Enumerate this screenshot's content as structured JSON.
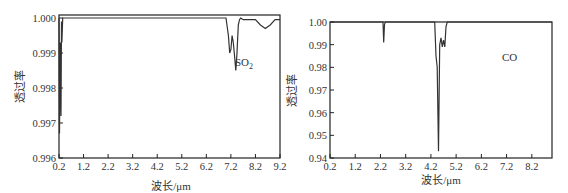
{
  "chart_data": [
    {
      "type": "line",
      "title": "",
      "annotation": "SO2",
      "xlabel": "波长/μm",
      "ylabel": "透过率",
      "xlim": [
        0.2,
        9.2
      ],
      "ylim": [
        0.996,
        1.0
      ],
      "xticks": [
        "0.2",
        "1.2",
        "2.2",
        "3.2",
        "4.2",
        "5.2",
        "6.2",
        "7.2",
        "8.2",
        "9.2"
      ],
      "yticks": [
        "0.996",
        "0.997",
        "0.998",
        "0.999",
        "1.000"
      ],
      "grid": false,
      "series": [
        {
          "name": "SO2",
          "x": [
            0.2,
            0.22,
            0.25,
            0.28,
            0.3,
            0.32,
            0.35,
            7.0,
            7.1,
            7.15,
            7.2,
            7.25,
            7.3,
            7.35,
            7.4,
            7.45,
            7.5,
            7.55,
            7.6,
            7.7,
            8.2,
            8.4,
            8.6,
            8.8,
            9.0,
            9.2
          ],
          "y": [
            1.0,
            0.9967,
            0.9993,
            0.9972,
            0.9999,
            0.9993,
            1.0,
            1.0,
            0.9995,
            0.999,
            0.9991,
            0.9995,
            0.9993,
            0.9989,
            0.9985,
            0.999,
            0.9998,
            0.99995,
            1.0,
            0.99995,
            0.99995,
            0.9998,
            0.9997,
            0.9998,
            0.99995,
            0.99995
          ]
        }
      ]
    },
    {
      "type": "line",
      "title": "",
      "annotation": "CO",
      "xlabel": "波长/μm",
      "ylabel": "透过率",
      "xlim": [
        0.2,
        9.0
      ],
      "ylim": [
        0.94,
        1.0
      ],
      "xticks": [
        "0.2",
        "1.2",
        "2.2",
        "3.2",
        "4.2",
        "5.2",
        "6.2",
        "7.2",
        "8.2"
      ],
      "yticks": [
        "0.94",
        "0.95",
        "0.96",
        "0.97",
        "0.98",
        "0.99",
        "1.00"
      ],
      "grid": false,
      "series": [
        {
          "name": "CO",
          "x": [
            0.2,
            2.3,
            2.33,
            2.36,
            2.4,
            4.35,
            4.4,
            4.45,
            4.5,
            4.55,
            4.6,
            4.65,
            4.7,
            4.75,
            4.8,
            4.85,
            9.0
          ],
          "y": [
            1.0,
            1.0,
            0.991,
            0.999,
            1.0,
            1.0,
            0.985,
            0.98,
            0.943,
            0.99,
            0.993,
            0.989,
            0.992,
            0.989,
            0.998,
            1.0,
            1.0
          ]
        }
      ]
    }
  ],
  "panels": {
    "left": {
      "annotation_main": "SO",
      "annotation_sub": "2",
      "xlabel": "波长/μm",
      "ylabel": "透过率"
    },
    "right": {
      "annotation": "CO",
      "xlabel": "波长/μm",
      "ylabel": "透过率"
    }
  }
}
